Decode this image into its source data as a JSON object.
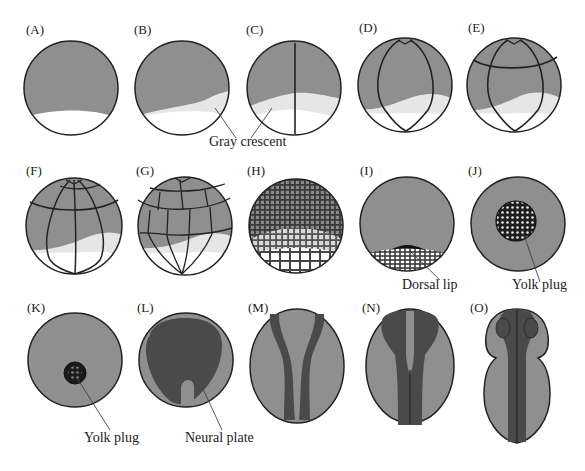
{
  "figure": {
    "colors": {
      "animal_pole": "#8f8f8f",
      "gray_crescent": "#e6e6e6",
      "vegetal": "#ffffff",
      "outline": "#222222",
      "neural_dark": "#4a4a4a",
      "yolk_plug": "#1a1a1a"
    },
    "panels": [
      {
        "id": "A",
        "label": "(A)"
      },
      {
        "id": "B",
        "label": "(B)"
      },
      {
        "id": "C",
        "label": "(C)"
      },
      {
        "id": "D",
        "label": "(D)"
      },
      {
        "id": "E",
        "label": "(E)"
      },
      {
        "id": "F",
        "label": "(F)"
      },
      {
        "id": "G",
        "label": "(G)"
      },
      {
        "id": "H",
        "label": "(H)"
      },
      {
        "id": "I",
        "label": "(I)"
      },
      {
        "id": "J",
        "label": "(J)"
      },
      {
        "id": "K",
        "label": "(K)"
      },
      {
        "id": "L",
        "label": "(L)"
      },
      {
        "id": "M",
        "label": "(M)"
      },
      {
        "id": "N",
        "label": "(N)"
      },
      {
        "id": "O",
        "label": "(O)"
      }
    ],
    "callouts": {
      "gray_crescent": "Gray crescent",
      "dorsal_lip": "Dorsal lip",
      "yolk_plug_j": "Yolk plug",
      "yolk_plug_k": "Yolk plug",
      "neural_plate": "Neural plate"
    }
  }
}
